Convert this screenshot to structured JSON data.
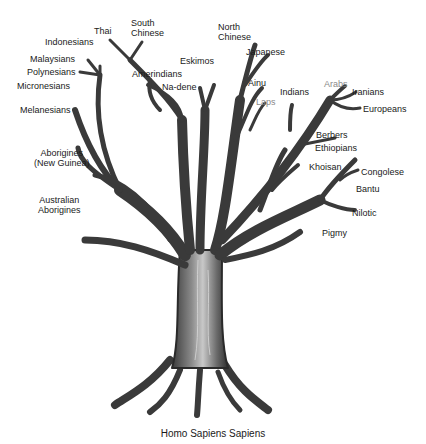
{
  "diagram": {
    "type": "phylogenetic-tree",
    "caption": "Homo Sapiens Sapiens",
    "labels": {
      "thai": "Thai",
      "south_chinese_1": "South",
      "south_chinese_2": "Chinese",
      "indonesians": "Indonesians",
      "malaysians": "Malaysians",
      "polynesians": "Polynesians",
      "micronesians": "Micronesians",
      "melanesians": "Melanesians",
      "amerindians": "Amerindians",
      "eskimos": "Eskimos",
      "na_dene": "Na-dene",
      "north_chinese_1": "North",
      "north_chinese_2": "Chinese",
      "japanese": "Japanese",
      "ainu": "Ainu",
      "laps": "Laps",
      "indians": "Indians",
      "arabs": "Arabs",
      "iranians": "Iranians",
      "europeans": "Europeans",
      "berbers": "Berbers",
      "ethiopians": "Ethiopians",
      "khoisan": "Khoisan",
      "congolese": "Congolese",
      "bantu": "Bantu",
      "nilotic": "Nilotic",
      "pigmy": "Pigmy",
      "aborigines_ng_1": "Aborigines",
      "aborigines_ng_2": "(New Guinea)",
      "australian_1": "Australian",
      "australian_2": "Aborigines"
    },
    "colors": {
      "ink": "#2a2a2a",
      "bark": "#5a5a5a",
      "highlight": "#d8d8d8",
      "gray_label": "#8a8a8a"
    }
  }
}
